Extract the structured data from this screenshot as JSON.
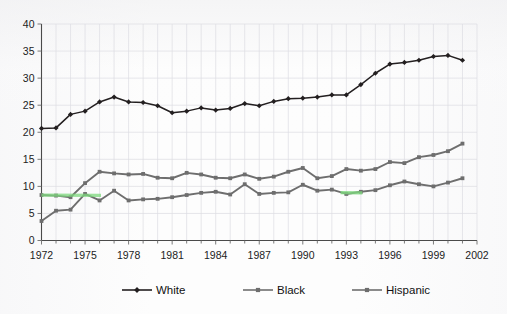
{
  "chart_data": {
    "type": "line",
    "title": "",
    "subtitle": "",
    "xlabel": "",
    "ylabel": "",
    "xlim": [
      1972,
      2002
    ],
    "ylim": [
      0,
      40
    ],
    "y_ticks": [
      0,
      5,
      10,
      15,
      20,
      25,
      30,
      35,
      40
    ],
    "x_tick_labels": [
      "1972",
      "1975",
      "1978",
      "1981",
      "1984",
      "1987",
      "1990",
      "1993",
      "1996",
      "1999",
      "2002"
    ],
    "x_tick_values": [
      1972,
      1975,
      1978,
      1981,
      1984,
      1987,
      1990,
      1993,
      1996,
      1999,
      2002
    ],
    "x_minor_step": 1,
    "grid": true,
    "grid_style": "faint vertical and horizontal light gray",
    "legend_position": "bottom",
    "x": [
      1972,
      1973,
      1974,
      1975,
      1976,
      1977,
      1978,
      1979,
      1980,
      1981,
      1982,
      1983,
      1984,
      1985,
      1986,
      1987,
      1988,
      1989,
      1990,
      1991,
      1992,
      1993,
      1994,
      1995,
      1996,
      1997,
      1998,
      1999,
      2000,
      2001
    ],
    "series": [
      {
        "name": "White",
        "color": "#231f20",
        "marker": "diamond",
        "values": [
          20.7,
          20.8,
          23.3,
          23.9,
          25.6,
          26.5,
          25.6,
          25.5,
          24.9,
          23.6,
          23.9,
          24.5,
          24.1,
          24.4,
          25.3,
          24.9,
          25.7,
          26.2,
          26.3,
          26.5,
          26.9,
          26.9,
          28.8,
          30.9,
          32.6,
          32.9,
          33.3,
          34.0,
          34.2,
          33.3
        ]
      },
      {
        "name": "Black",
        "color": "#6e6e6e",
        "marker": "square",
        "values": [
          8.4,
          8.3,
          8.0,
          10.6,
          12.7,
          12.4,
          12.2,
          12.3,
          11.6,
          11.5,
          12.5,
          12.2,
          11.6,
          11.5,
          12.2,
          11.4,
          11.8,
          12.7,
          13.4,
          11.5,
          11.9,
          13.2,
          12.9,
          13.2,
          14.5,
          14.3,
          15.4,
          15.8,
          16.5,
          17.9
        ]
      },
      {
        "name": "Hispanic",
        "color": "#6e6e6e",
        "marker": "square",
        "values": [
          3.6,
          5.5,
          5.7,
          8.6,
          7.4,
          9.2,
          7.4,
          7.6,
          7.7,
          8.0,
          8.4,
          8.8,
          9.0,
          8.5,
          10.4,
          8.6,
          8.8,
          8.9,
          10.3,
          9.2,
          9.4,
          8.6,
          9.0,
          9.3,
          10.2,
          10.9,
          10.4,
          10.0,
          10.7,
          11.5
        ]
      }
    ],
    "annotations": [
      {
        "text": "highlighted segment 1972-1976 on Hispanic/Black overlap",
        "color": "#7dd87d"
      },
      {
        "text": "highlighted segment 1992-1994 on Hispanic",
        "color": "#7dd87d"
      }
    ]
  },
  "legend": {
    "items": [
      {
        "label": "White"
      },
      {
        "label": "Black"
      },
      {
        "label": "Hispanic"
      }
    ]
  },
  "axes": {
    "y_labels": [
      "40",
      "35",
      "30",
      "25",
      "20",
      "15",
      "10",
      "5",
      "0"
    ],
    "x_labels": [
      "1972",
      "1975",
      "1978",
      "1981",
      "1984",
      "1987",
      "1990",
      "1993",
      "1996",
      "1999",
      "2002"
    ]
  }
}
